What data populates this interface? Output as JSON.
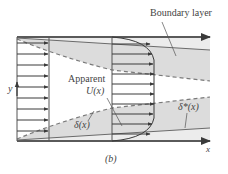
{
  "diagram": {
    "panel_label": "(b)",
    "labels": {
      "boundary_layer": "Boundary layer",
      "apparent": "Apparent",
      "core_velocity": "U(x)",
      "delta": "δ(x)",
      "delta_star": "δ*(x)",
      "y_axis": "y",
      "x_axis": "x"
    },
    "colors": {
      "wall": "#6b6b6b",
      "shade": "#d9d9d9",
      "arrow": "#3a3a3a",
      "dashed": "#7a7a7a",
      "text": "#444444"
    },
    "elements": [
      "upper wall",
      "lower wall",
      "inlet uniform velocity profile",
      "downstream velocity profile",
      "boundary layer thickness delta (dashed)",
      "displacement thickness delta-star (solid)",
      "shaded boundary-layer region"
    ]
  }
}
